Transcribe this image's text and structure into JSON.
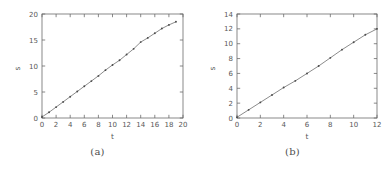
{
  "figure": {
    "panels": [
      {
        "id": "a",
        "caption": "(a)",
        "chart_data": {
          "type": "line",
          "title": "",
          "xlabel": "t",
          "ylabel": "s",
          "xlim": [
            0,
            20
          ],
          "ylim": [
            0,
            20
          ],
          "xticks": [
            0,
            2,
            4,
            6,
            8,
            10,
            12,
            14,
            16,
            18,
            20
          ],
          "yticks": [
            0,
            5,
            10,
            15,
            20
          ],
          "xticklabels": [
            "0",
            "2",
            "4",
            "6",
            "8",
            "10",
            "12",
            "14",
            "16",
            "18",
            "20"
          ],
          "yticklabels": [
            "0",
            "5",
            "10",
            "15",
            "20"
          ],
          "grid": false,
          "legend": "none",
          "marker": "point",
          "line_color": "#6f6f6f",
          "marker_color": "#4a4a4a",
          "series": [
            {
              "name": "s(t)",
              "x": [
                0,
                1,
                2,
                3,
                4,
                5,
                6,
                7,
                8,
                9,
                10,
                11,
                12,
                13,
                14,
                15,
                16,
                17,
                18,
                19
              ],
              "y": [
                0.2,
                1.1,
                2.1,
                3.1,
                4.1,
                5.1,
                6.1,
                7.1,
                8.1,
                9.2,
                10.2,
                11.1,
                12.2,
                13.3,
                14.6,
                15.4,
                16.3,
                17.2,
                17.9,
                18.5
              ]
            }
          ]
        }
      },
      {
        "id": "b",
        "caption": "(b)",
        "chart_data": {
          "type": "line",
          "title": "",
          "xlabel": "t",
          "ylabel": "s",
          "xlim": [
            0,
            12
          ],
          "ylim": [
            0,
            14
          ],
          "xticks": [
            0,
            2,
            4,
            6,
            8,
            10,
            12
          ],
          "yticks": [
            0,
            2,
            4,
            6,
            8,
            10,
            12,
            14
          ],
          "xticklabels": [
            "0",
            "2",
            "4",
            "6",
            "8",
            "10",
            "12"
          ],
          "yticklabels": [
            "0",
            "2",
            "4",
            "6",
            "8",
            "10",
            "12",
            "14"
          ],
          "grid": false,
          "legend": "none",
          "marker": "point",
          "line_color": "#6f6f6f",
          "marker_color": "#4a4a4a",
          "series": [
            {
              "name": "s(t)",
              "x": [
                0,
                1,
                2,
                3,
                4,
                5,
                6,
                7,
                8,
                9,
                10,
                11,
                12
              ],
              "y": [
                0.1,
                1.1,
                2.1,
                3.1,
                4.1,
                5.0,
                6.0,
                7.0,
                8.1,
                9.2,
                10.2,
                11.2,
                12.0
              ]
            }
          ]
        }
      }
    ]
  }
}
